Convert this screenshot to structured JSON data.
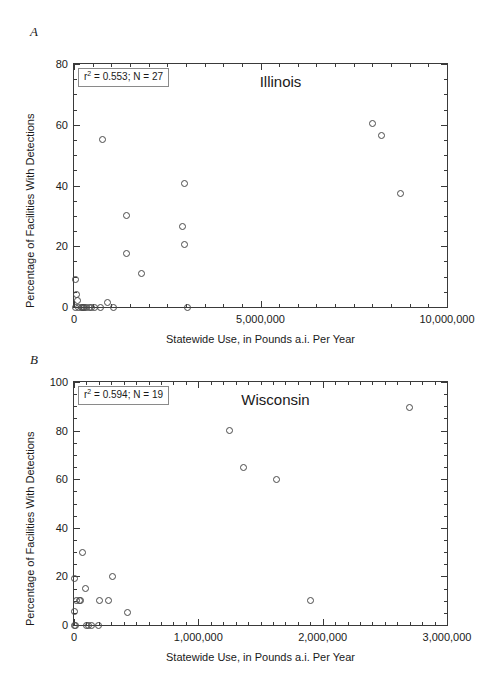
{
  "figure": {
    "panel_a_letter": "A",
    "panel_b_letter": "B"
  },
  "chart_data": [
    {
      "type": "scatter",
      "panel": "A",
      "title": "Illinois",
      "xlabel": "Statewide Use, in Pounds a.i. Per Year",
      "ylabel": "Percentage of Facilities With Detections",
      "annotation": "r2 = 0.553; N = 27",
      "annotation_r2_value": "0.553",
      "annotation_n_value": "27",
      "xlim": [
        0,
        10000000
      ],
      "ylim": [
        0,
        80
      ],
      "xticks": [
        0,
        5000000,
        10000000
      ],
      "xtick_labels": [
        "0",
        "5,000,000",
        "10,000,000"
      ],
      "x_minor_step": 500000,
      "yticks": [
        0,
        20,
        40,
        60,
        80
      ],
      "ytick_labels": [
        "0",
        "20",
        "40",
        "60",
        "80"
      ],
      "y_minor_step": 5,
      "grid": false,
      "legend": "none",
      "points": [
        {
          "x": 30000,
          "y": 9.0
        },
        {
          "x": 60000,
          "y": 4.0
        },
        {
          "x": 90000,
          "y": 2.0
        },
        {
          "x": 40000,
          "y": 0.0
        },
        {
          "x": 120000,
          "y": 0.0
        },
        {
          "x": 200000,
          "y": 0.0
        },
        {
          "x": 230000,
          "y": 0.0
        },
        {
          "x": 260000,
          "y": 0.0
        },
        {
          "x": 290000,
          "y": 0.0
        },
        {
          "x": 330000,
          "y": 0.0
        },
        {
          "x": 420000,
          "y": 0.0
        },
        {
          "x": 480000,
          "y": 0.0
        },
        {
          "x": 560000,
          "y": 0.0
        },
        {
          "x": 700000,
          "y": 0.0
        },
        {
          "x": 760000,
          "y": 55.0
        },
        {
          "x": 900000,
          "y": 1.5
        },
        {
          "x": 1050000,
          "y": 0.0
        },
        {
          "x": 1400000,
          "y": 30.0
        },
        {
          "x": 1420000,
          "y": 17.5
        },
        {
          "x": 1800000,
          "y": 11.0
        },
        {
          "x": 2950000,
          "y": 40.5
        },
        {
          "x": 2900000,
          "y": 26.5
        },
        {
          "x": 2950000,
          "y": 20.5
        },
        {
          "x": 3050000,
          "y": 0.0
        },
        {
          "x": 8000000,
          "y": 60.5
        },
        {
          "x": 8250000,
          "y": 56.5
        },
        {
          "x": 8750000,
          "y": 37.5
        }
      ]
    },
    {
      "type": "scatter",
      "panel": "B",
      "title": "Wisconsin",
      "xlabel": "Statewide Use, in Pounds a.i. Per Year",
      "ylabel": "Percentage of Facilities With Detections",
      "annotation": "r2 = 0.594; N = 19",
      "annotation_r2_value": "0.594",
      "annotation_n_value": "19",
      "xlim": [
        0,
        3000000
      ],
      "ylim": [
        0,
        100
      ],
      "xticks": [
        0,
        1000000,
        2000000,
        3000000
      ],
      "xtick_labels": [
        "0",
        "1,000,000",
        "2,000,000",
        "3,000,000"
      ],
      "x_minor_step": 100000,
      "yticks": [
        0,
        20,
        40,
        60,
        80,
        100
      ],
      "ytick_labels": [
        "0",
        "20",
        "40",
        "60",
        "80",
        "100"
      ],
      "y_minor_step": 5,
      "grid": false,
      "legend": "none",
      "points": [
        {
          "x": 8000,
          "y": 19.0
        },
        {
          "x": 8000,
          "y": 5.5
        },
        {
          "x": 6000,
          "y": 0.0
        },
        {
          "x": 12000,
          "y": 0.0
        },
        {
          "x": 20000,
          "y": 10.0
        },
        {
          "x": 45000,
          "y": 10.0
        },
        {
          "x": 55000,
          "y": 10.0
        },
        {
          "x": 70000,
          "y": 30.0
        },
        {
          "x": 95000,
          "y": 15.0
        },
        {
          "x": 100000,
          "y": 0.0
        },
        {
          "x": 120000,
          "y": 0.0
        },
        {
          "x": 140000,
          "y": 0.0
        },
        {
          "x": 200000,
          "y": 0.0
        },
        {
          "x": 205000,
          "y": 10.0
        },
        {
          "x": 275000,
          "y": 10.0
        },
        {
          "x": 310000,
          "y": 20.0
        },
        {
          "x": 430000,
          "y": 5.0
        },
        {
          "x": 1250000,
          "y": 80.0
        },
        {
          "x": 1360000,
          "y": 65.0
        },
        {
          "x": 1630000,
          "y": 60.0
        },
        {
          "x": 1900000,
          "y": 10.0
        },
        {
          "x": 2700000,
          "y": 89.5
        }
      ]
    }
  ]
}
